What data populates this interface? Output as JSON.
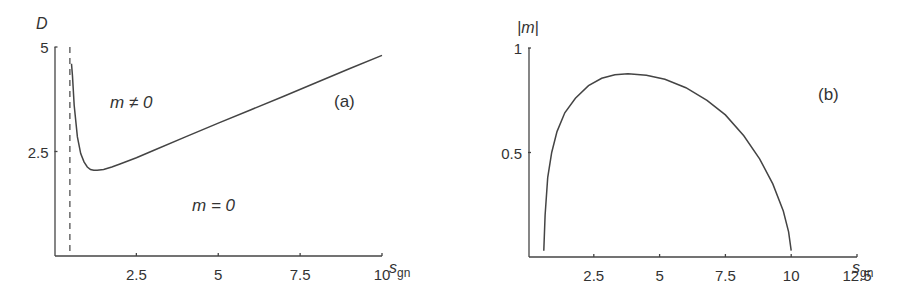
{
  "chart_data": [
    {
      "id": "a",
      "type": "line",
      "panel_label": "(a)",
      "title": "",
      "xlabel": "s",
      "xlabel_subscript": "gn",
      "ylabel": "D",
      "xlim": [
        0,
        10
      ],
      "ylim": [
        0,
        5
      ],
      "xticks": [
        "2.5",
        "5",
        "7.5",
        "10"
      ],
      "yticks": [
        "2.5",
        "5"
      ],
      "grid": false,
      "annotations": [
        "m ≠ 0",
        "m = 0"
      ],
      "vertical_dashed_line_x": 0.47,
      "series": [
        {
          "name": "phase boundary D(s_gn)",
          "x": [
            0.52,
            0.55,
            0.6,
            0.7,
            0.8,
            0.9,
            1.0,
            1.1,
            1.2,
            1.3,
            1.5,
            1.75,
            2.0,
            2.5,
            3.0,
            4.0,
            5.0,
            6.0,
            7.0,
            8.0,
            9.0,
            10.0
          ],
          "y": [
            4.6,
            4.3,
            3.6,
            2.85,
            2.45,
            2.25,
            2.13,
            2.07,
            2.05,
            2.05,
            2.07,
            2.13,
            2.2,
            2.35,
            2.52,
            2.85,
            3.18,
            3.5,
            3.82,
            4.15,
            4.48,
            4.8
          ]
        }
      ]
    },
    {
      "id": "b",
      "type": "line",
      "panel_label": "(b)",
      "title": "",
      "xlabel": "s",
      "xlabel_subscript": "gn",
      "ylabel": "|m|",
      "xlim": [
        0,
        12.5
      ],
      "ylim": [
        0,
        1
      ],
      "xticks": [
        "2.5",
        "5",
        "7.5",
        "10",
        "12.5"
      ],
      "yticks": [
        "0.5",
        "1"
      ],
      "grid": false,
      "series": [
        {
          "name": "|m| vs s_gn",
          "x": [
            0.6,
            0.65,
            0.75,
            0.9,
            1.1,
            1.4,
            1.8,
            2.3,
            2.8,
            3.3,
            3.8,
            4.5,
            5.2,
            6.0,
            6.8,
            7.5,
            8.2,
            8.8,
            9.3,
            9.7,
            9.9,
            10.0
          ],
          "y": [
            0.03,
            0.2,
            0.38,
            0.5,
            0.6,
            0.69,
            0.76,
            0.82,
            0.855,
            0.872,
            0.877,
            0.87,
            0.85,
            0.81,
            0.75,
            0.68,
            0.58,
            0.47,
            0.35,
            0.22,
            0.12,
            0.03
          ]
        }
      ]
    }
  ]
}
